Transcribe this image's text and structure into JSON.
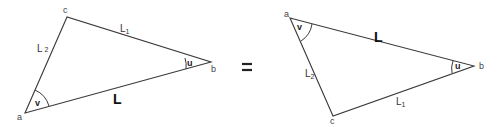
{
  "left_triangle": {
    "vertices": {
      "a": "a",
      "b": "b",
      "c": "c"
    },
    "sides": {
      "ab": {
        "base": "L",
        "sub": ""
      },
      "cb": {
        "base": "L",
        "sub": "1"
      },
      "ac": {
        "base": "L",
        "sub": "2"
      }
    },
    "angles": {
      "at_b": "u",
      "at_a": "v"
    }
  },
  "operator": "=",
  "right_triangle": {
    "vertices": {
      "a": "a",
      "b": "b",
      "c": "c"
    },
    "sides": {
      "ab": {
        "base": "L",
        "sub": ""
      },
      "cb": {
        "base": "L",
        "sub": "1"
      },
      "ac": {
        "base": "L",
        "sub": "2"
      }
    },
    "angles": {
      "at_b": "u",
      "at_a": "v"
    }
  },
  "colors": {
    "line": "#3a3a3a",
    "text": "#222222",
    "background": "#ffffff"
  }
}
